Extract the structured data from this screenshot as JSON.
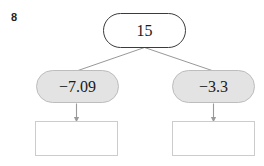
{
  "problem": {
    "number": "8"
  },
  "diagram": {
    "type": "number-split-tree",
    "root": {
      "label": "15",
      "shape": "rounded-rectangle",
      "fill": "#ffffff",
      "border": "#3b3b3b"
    },
    "children": [
      {
        "label": "−7.09",
        "shape": "rounded-rectangle",
        "fill": "#e3e3e3",
        "border": "#bdbdbd",
        "position": "left"
      },
      {
        "label": "−3.3",
        "shape": "rounded-rectangle",
        "fill": "#e3e3e3",
        "border": "#bdbdbd",
        "position": "right"
      }
    ],
    "answer_boxes": [
      {
        "value": "",
        "position": "left"
      },
      {
        "value": "",
        "position": "right"
      }
    ],
    "connectors": {
      "branch_color": "#8c8c8c",
      "arrow_color": "#9a9a9a"
    }
  }
}
